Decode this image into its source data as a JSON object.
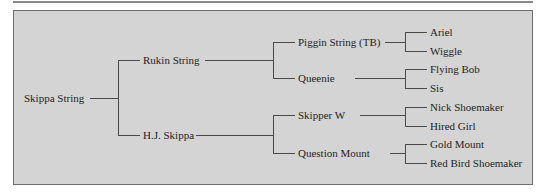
{
  "pedigree": {
    "subject": "Skippa String",
    "sire": {
      "name": "Rukin String",
      "sire": {
        "name": "Piggin String (TB)",
        "sire": "Ariel",
        "dam": "Wiggle"
      },
      "dam": {
        "name": "Queenie",
        "sire": "Flying Bob",
        "dam": "Sis"
      }
    },
    "dam": {
      "name": "H.J. Skippa",
      "sire": {
        "name": "Skipper W",
        "sire": "Nick Shoemaker",
        "dam": "Hired Girl"
      },
      "dam": {
        "name": "Question Mount",
        "sire": "Gold Mount",
        "dam": "Red Bird Shoemaker"
      }
    }
  },
  "colors": {
    "panel_background": "#d4d4d4",
    "line": "#4a4a4a",
    "text": "#1e1e1e",
    "border": "#6e6e6e"
  }
}
